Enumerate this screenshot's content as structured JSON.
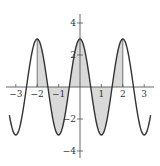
{
  "chart_data": {
    "type": "line",
    "title": "",
    "function": "y = 3cos(pi x)",
    "xlabel": "",
    "ylabel": "",
    "xlim": [
      -3.5,
      3.5
    ],
    "ylim": [
      -4.5,
      4.5
    ],
    "x_ticks": [
      -3,
      -2,
      -1,
      1,
      2,
      3
    ],
    "x_tick_labels": [
      "−3",
      "−2",
      "−1",
      "1",
      "2",
      "3"
    ],
    "y_ticks": [
      4,
      2,
      -2,
      -4
    ],
    "y_tick_labels": [
      "4",
      "2",
      "−2",
      "−4"
    ],
    "shaded_region": {
      "from_x": -2,
      "to_x": 2,
      "between": "curve and x-axis"
    },
    "series": [
      {
        "name": "f(x)",
        "x": [
          -3.3,
          -3,
          -2.5,
          -2,
          -1.5,
          -1,
          -0.5,
          0,
          0.5,
          1,
          1.5,
          2,
          2.5,
          3,
          3.3
        ],
        "values": [
          -1.76,
          -3,
          0,
          3,
          0,
          -3,
          0,
          3,
          0,
          -3,
          0,
          3,
          0,
          -3,
          -1.76
        ]
      }
    ],
    "grid": false,
    "legend": null,
    "colors": {
      "curve": "#333333",
      "shade": "#d9d9d9",
      "axis": "#555555"
    }
  }
}
